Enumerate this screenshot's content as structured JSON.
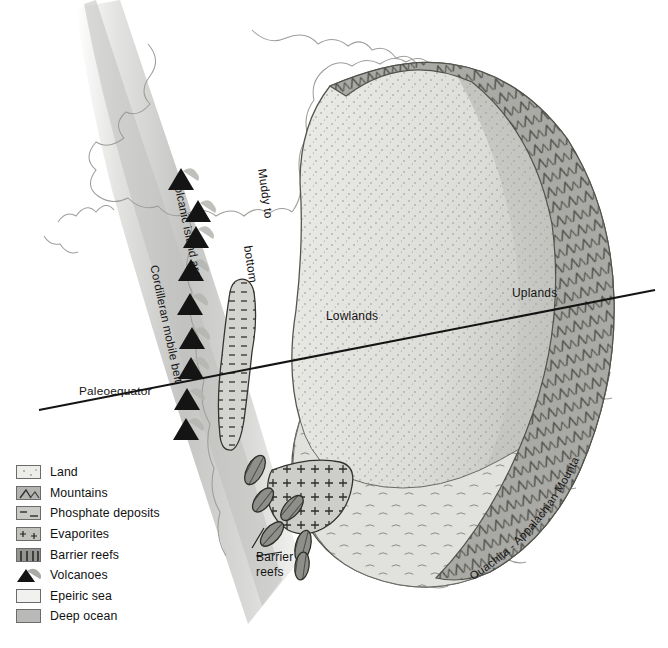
{
  "figure": {
    "type": "paleogeographic-map",
    "region": "North America",
    "palette": {
      "land": "#ededea",
      "uplands": "#c3c3bf",
      "mountains": "#a9a9a6",
      "epeiric_sea": "#e3e3e0",
      "deep_ocean": "#c6c6c4",
      "coastline_outline": "#9a9a96",
      "line": "#1a1a1a",
      "reef": "#8a8a86",
      "volcano": "#141414"
    }
  },
  "map_labels": {
    "lowlands": "Lowlands",
    "uplands": "Uplands",
    "paleoequator": "Paleoequator",
    "cordilleran_mobile_belt": "Cordilleran mobile belt",
    "volcanic_island_arc": "Volcanic island arc",
    "muddy_line1": "Muddy to",
    "muddy_line2": "sandy",
    "muddy_line3": "bottom",
    "muddy_full": "Muddy to sandy bottom",
    "ouachita_appalachian": "Ouachita - Appalachian Mountains",
    "barrier_reefs_line1": "Barrier",
    "barrier_reefs_line2": "reefs"
  },
  "legend": {
    "items": [
      {
        "label": "Land",
        "swatch": "sw-land",
        "icon": "land-swatch"
      },
      {
        "label": "Mountains",
        "swatch": "sw-mtn",
        "icon": "mountains-swatch"
      },
      {
        "label": "Phosphate deposits",
        "swatch": "sw-phos",
        "icon": "phosphate-swatch"
      },
      {
        "label": "Evaporites",
        "swatch": "sw-evap",
        "icon": "evaporites-swatch"
      },
      {
        "label": "Barrier reefs",
        "swatch": "sw-reef",
        "icon": "barrier-reefs-swatch"
      },
      {
        "label": "Volcanoes",
        "swatch": "sw-vol",
        "icon": "volcano-icon"
      },
      {
        "label": "Epeiric sea",
        "swatch": "sw-epeiric",
        "icon": "epeiric-sea-swatch"
      },
      {
        "label": "Deep ocean",
        "swatch": "sw-ocean",
        "icon": "deep-ocean-swatch"
      }
    ]
  },
  "features": {
    "volcano_count": 9,
    "barrier_reef_count": 6,
    "phosphate_deposit_count": 1,
    "evaporite_basin_count": 1
  }
}
